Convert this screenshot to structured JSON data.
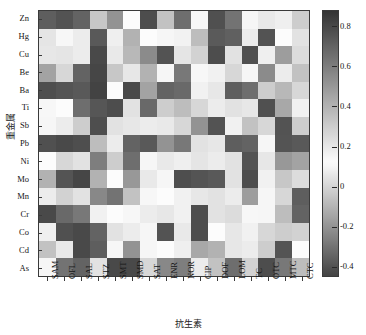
{
  "chart_data": {
    "type": "heatmap",
    "title": "",
    "xlabel": "抗生素",
    "ylabel": "重金属",
    "colormap": "grayscale-diverging",
    "grid": false,
    "legend_position": "right-colorbar",
    "categories_x": [
      "SAM",
      "OFL",
      "SAL",
      "STZ",
      "SMT",
      "SMD",
      "SAT",
      "ENR",
      "NOR",
      "CIP",
      "DOF",
      "LOM",
      "TC",
      "OTC",
      "MTC",
      "CTC"
    ],
    "categories_y": [
      "Zn",
      "Hg",
      "Cu",
      "Be",
      "Ba",
      "Ti",
      "Sb",
      "Pb",
      "Ni",
      "Mo",
      "Mn",
      "Cr",
      "Co",
      "Cd",
      "As"
    ],
    "colorbar": {
      "ticks": [
        "0.8",
        "0.6",
        "0.4",
        "0.2",
        "0",
        "-0.2",
        "-0.4"
      ],
      "tick_values": [
        0.8,
        0.6,
        0.4,
        0.2,
        0,
        -0.2,
        -0.4
      ],
      "vmin": -0.45,
      "vmax": 0.88
    },
    "zlim": [
      -0.45,
      0.88
    ],
    "values": [
      [
        0.72,
        -0.4,
        0.7,
        0.32,
        0.52,
        0.12,
        -0.42,
        0.34,
        0.66,
        0.14,
        -0.41,
        0.64,
        0.1,
        0.06,
        0.08,
        0.3
      ],
      [
        0.05,
        0.14,
        0.18,
        0.74,
        0.08,
        0.4,
        0.12,
        0.1,
        0.09,
        0.36,
        -0.38,
        -0.36,
        0.07,
        -0.4,
        0.12,
        0.22
      ],
      [
        0.2,
        0.05,
        0.07,
        0.8,
        0.06,
        0.38,
        0.55,
        -0.4,
        0.05,
        0.28,
        -0.42,
        0.04,
        -0.41,
        0.08,
        0.48,
        0.24
      ],
      [
        0.46,
        0.26,
        0.7,
        -0.44,
        0.32,
        0.2,
        0.4,
        0.1,
        0.62,
        0.14,
        0.16,
        0.26,
        0.1,
        0.55,
        0.18,
        0.34
      ],
      [
        0.78,
        0.76,
        0.74,
        -0.45,
        0.12,
        -0.43,
        0.46,
        0.7,
        0.68,
        0.16,
        0.2,
        0.72,
        0.66,
        0.3,
        0.38,
        0.26
      ],
      [
        0.14,
        0.12,
        0.66,
        0.75,
        -0.42,
        0.22,
        0.68,
        0.3,
        0.36,
        0.26,
        0.18,
        0.22,
        0.2,
        -0.41,
        0.44,
        0.16
      ],
      [
        0.1,
        0.18,
        0.3,
        0.78,
        0.22,
        0.2,
        0.18,
        0.06,
        0.26,
        0.52,
        -0.4,
        0.16,
        0.34,
        0.26,
        -0.4,
        0.3
      ],
      [
        -0.41,
        0.8,
        0.78,
        0.36,
        0.18,
        0.7,
        0.74,
        0.52,
        0.62,
        0.22,
        0.2,
        0.72,
        0.7,
        0.1,
        0.76,
        0.74
      ],
      [
        0.12,
        0.26,
        0.22,
        0.6,
        0.3,
        0.66,
        0.1,
        0.06,
        0.08,
        0.05,
        0.07,
        0.04,
        -0.4,
        0.2,
        0.5,
        0.46
      ],
      [
        0.4,
        0.76,
        -0.44,
        0.4,
        0.12,
        0.5,
        0.06,
        0.1,
        0.78,
        0.76,
        0.74,
        0.22,
        -0.42,
        0.16,
        0.32,
        0.24
      ],
      [
        0.18,
        0.28,
        0.22,
        0.56,
        0.64,
        0.34,
        0.14,
        0.12,
        0.16,
        0.2,
        0.22,
        0.18,
        0.48,
        0.1,
        0.26,
        0.72
      ],
      [
        0.8,
        0.68,
        0.62,
        0.16,
        0.12,
        0.14,
        0.18,
        0.2,
        0.16,
        -0.42,
        0.22,
        0.24,
        0.14,
        0.1,
        0.36,
        0.7
      ],
      [
        0.08,
        -0.41,
        -0.43,
        0.7,
        0.22,
        0.18,
        0.1,
        -0.4,
        0.06,
        -0.42,
        0.12,
        0.2,
        0.16,
        0.26,
        0.3,
        0.28
      ],
      [
        0.34,
        0.06,
        0.8,
        0.72,
        0.14,
        0.52,
        0.1,
        0.12,
        0.08,
        0.44,
        0.4,
        0.2,
        0.18,
        0.3,
        0.76,
        0.12
      ],
      [
        0.1,
        0.64,
        0.7,
        0.22,
        -0.43,
        0.8,
        0.26,
        0.56,
        0.6,
        0.18,
        0.34,
        0.66,
        0.28,
        -0.42,
        0.62,
        0.36
      ]
    ]
  },
  "axes": {
    "y_title": "重金属",
    "x_title": "抗生素"
  }
}
